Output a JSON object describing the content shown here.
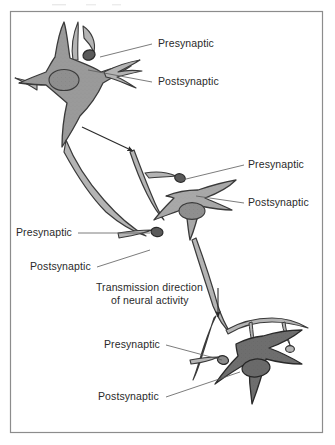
{
  "figure": {
    "frame_border_color": "#8c8c8c",
    "background_color": "#ffffff",
    "ink_color": "#2a2a2a"
  },
  "colors": {
    "neuron_top_fill": "#9a9a9a",
    "neuron_middle_fill": "#a8a8a8",
    "neuron_bottom_fill": "#6e6e6e",
    "process_fill": "#b4b4b4",
    "bouton_dark_fill": "#5a5a5a",
    "nucleus_fill": "#8f8f8f",
    "outline": "#3a3a3a",
    "leader_line": "#5a5a5a"
  },
  "labels": [
    {
      "id": "label-presynaptic-1",
      "text": "Presynaptic",
      "x": 158,
      "y": 47,
      "anchor": "start",
      "leader": {
        "x1": 152,
        "y1": 44,
        "x2": 100,
        "y2": 57
      }
    },
    {
      "id": "label-postsynaptic-1",
      "text": "Postsynaptic",
      "x": 158,
      "y": 85,
      "anchor": "start",
      "leader": {
        "x1": 152,
        "y1": 82,
        "x2": 88,
        "y2": 70
      }
    },
    {
      "id": "label-presynaptic-2",
      "text": "Presynaptic",
      "x": 248,
      "y": 168,
      "anchor": "start",
      "leader": {
        "x1": 244,
        "y1": 165,
        "x2": 182,
        "y2": 180
      }
    },
    {
      "id": "label-postsynaptic-2",
      "text": "Postsynaptic",
      "x": 248,
      "y": 206,
      "anchor": "start",
      "leader": {
        "x1": 244,
        "y1": 203,
        "x2": 196,
        "y2": 196
      }
    },
    {
      "id": "label-presynaptic-3",
      "text": "Presynaptic",
      "x": 16,
      "y": 236,
      "anchor": "start",
      "leader": {
        "x1": 78,
        "y1": 233,
        "x2": 150,
        "y2": 233
      }
    },
    {
      "id": "label-postsynaptic-3",
      "text": "Postsynaptic",
      "x": 30,
      "y": 270,
      "anchor": "start",
      "leader": {
        "x1": 97,
        "y1": 267,
        "x2": 150,
        "y2": 250
      }
    },
    {
      "id": "label-presynaptic-4",
      "text": "Presynaptic",
      "x": 104,
      "y": 348,
      "anchor": "start",
      "leader": {
        "x1": 166,
        "y1": 345,
        "x2": 222,
        "y2": 360
      }
    },
    {
      "id": "label-postsynaptic-4",
      "text": "Postsynaptic",
      "x": 98,
      "y": 400,
      "anchor": "start",
      "leader": {
        "x1": 166,
        "y1": 397,
        "x2": 240,
        "y2": 372
      }
    }
  ],
  "annotation": {
    "id": "transmission-note",
    "line1": "Transmission direction",
    "line2": "of neural activity",
    "line1_x": 96,
    "line1_y": 291,
    "line2_x": 111,
    "line2_y": 304
  },
  "arrows": [
    {
      "id": "arrow-axon-1",
      "x1": 82,
      "y1": 127,
      "x2": 133,
      "y2": 151
    },
    {
      "id": "arrow-axon-2",
      "x1": 218,
      "y1": 288,
      "x2": 218,
      "y2": 317
    }
  ]
}
